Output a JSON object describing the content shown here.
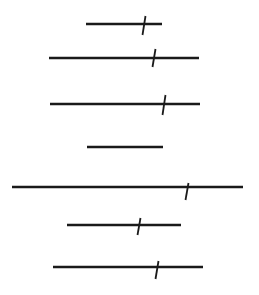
{
  "figure": {
    "width": 259,
    "height": 295,
    "background": "#ffffff",
    "stroke_color": "#1a1a1a",
    "segments": [
      {
        "x1": 86,
        "x2": 162,
        "y": 24,
        "tick": {
          "x": 144,
          "top": 16,
          "bottom": 35,
          "slant": 3
        }
      },
      {
        "x1": 49,
        "x2": 199,
        "y": 58,
        "tick": {
          "x": 154,
          "top": 49,
          "bottom": 67,
          "slant": 3
        }
      },
      {
        "x1": 50,
        "x2": 200,
        "y": 104,
        "tick": {
          "x": 164,
          "top": 95,
          "bottom": 115,
          "slant": 3
        }
      },
      {
        "x1": 87,
        "x2": 163,
        "y": 147,
        "tick": null
      },
      {
        "x1": 12,
        "x2": 243,
        "y": 187,
        "tick": {
          "x": 187,
          "top": 183,
          "bottom": 200,
          "slant": 3
        }
      },
      {
        "x1": 67,
        "x2": 181,
        "y": 225,
        "tick": {
          "x": 139,
          "top": 218,
          "bottom": 235,
          "slant": 3
        }
      },
      {
        "x1": 53,
        "x2": 203,
        "y": 267,
        "tick": {
          "x": 157,
          "top": 261,
          "bottom": 279,
          "slant": 3
        }
      }
    ]
  }
}
